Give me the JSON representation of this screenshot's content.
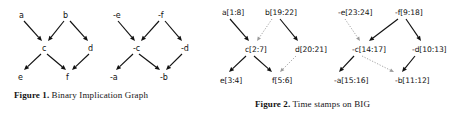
{
  "figures": [
    {
      "id": "figure-1",
      "caption_label": "Figure 1.",
      "caption_text": "Binary Implication Graph",
      "nodes": [
        {
          "name": "node-a",
          "label": "a",
          "x": 19,
          "y": 11
        },
        {
          "name": "node-b",
          "label": "b",
          "x": 63,
          "y": 11
        },
        {
          "name": "node-c",
          "label": "c",
          "x": 42,
          "y": 44
        },
        {
          "name": "node-d",
          "label": "d",
          "x": 88,
          "y": 44
        },
        {
          "name": "node-e",
          "label": "e",
          "x": 18,
          "y": 73
        },
        {
          "name": "node-f",
          "label": "f",
          "x": 66,
          "y": 73
        },
        {
          "name": "node-neg-e",
          "label": "-e",
          "x": 113,
          "y": 11
        },
        {
          "name": "node-neg-f",
          "label": "-f",
          "x": 158,
          "y": 11
        },
        {
          "name": "node-neg-c",
          "label": "-c",
          "x": 133,
          "y": 44
        },
        {
          "name": "node-neg-d",
          "label": "-d",
          "x": 181,
          "y": 44
        },
        {
          "name": "node-neg-a",
          "label": "-a",
          "x": 110,
          "y": 73
        },
        {
          "name": "node-neg-b",
          "label": "-b",
          "x": 160,
          "y": 73
        }
      ],
      "edges": [
        {
          "name": "edge-a-c",
          "from": [
            24,
            21
          ],
          "to": [
            42,
            41
          ],
          "style": "solid"
        },
        {
          "name": "edge-b-c",
          "from": [
            64,
            21
          ],
          "to": [
            48,
            41
          ],
          "style": "solid"
        },
        {
          "name": "edge-b-d",
          "from": [
            70,
            21
          ],
          "to": [
            88,
            41
          ],
          "style": "solid"
        },
        {
          "name": "edge-c-e",
          "from": [
            41,
            54
          ],
          "to": [
            24,
            70
          ],
          "style": "solid"
        },
        {
          "name": "edge-c-f",
          "from": [
            47,
            54
          ],
          "to": [
            66,
            70
          ],
          "style": "solid"
        },
        {
          "name": "edge-d-f",
          "from": [
            89,
            54
          ],
          "to": [
            72,
            70
          ],
          "style": "solid"
        },
        {
          "name": "edge-neg-e-neg-c",
          "from": [
            118,
            21
          ],
          "to": [
            135,
            41
          ],
          "style": "solid"
        },
        {
          "name": "edge-neg-f-neg-c",
          "from": [
            159,
            21
          ],
          "to": [
            141,
            41
          ],
          "style": "solid"
        },
        {
          "name": "edge-neg-f-neg-d",
          "from": [
            165,
            21
          ],
          "to": [
            182,
            41
          ],
          "style": "solid"
        },
        {
          "name": "edge-neg-c-neg-a",
          "from": [
            133,
            54
          ],
          "to": [
            116,
            70
          ],
          "style": "solid"
        },
        {
          "name": "edge-neg-c-neg-b",
          "from": [
            139,
            54
          ],
          "to": [
            160,
            70
          ],
          "style": "solid"
        },
        {
          "name": "edge-neg-d-neg-b",
          "from": [
            182,
            54
          ],
          "to": [
            166,
            70
          ],
          "style": "solid"
        }
      ]
    },
    {
      "id": "figure-2",
      "caption_label": "Figure 2.",
      "caption_text": "Time stamps on BIG",
      "nodes": [
        {
          "name": "node-a",
          "label": "a[1:8]",
          "x": 4,
          "y": 8
        },
        {
          "name": "node-b",
          "label": "b[19:22]",
          "x": 47,
          "y": 8
        },
        {
          "name": "node-c",
          "label": "c[2:7]",
          "x": 27,
          "y": 45
        },
        {
          "name": "node-d",
          "label": "d[20:21]",
          "x": 77,
          "y": 45
        },
        {
          "name": "node-e",
          "label": "e[3:4]",
          "x": 2,
          "y": 76
        },
        {
          "name": "node-f",
          "label": "f[5:6]",
          "x": 54,
          "y": 76
        },
        {
          "name": "node-neg-e",
          "label": "-e[23:24]",
          "x": 120,
          "y": 8
        },
        {
          "name": "node-neg-f",
          "label": "-f[9:18]",
          "x": 177,
          "y": 8
        },
        {
          "name": "node-neg-c",
          "label": "-c[14:17]",
          "x": 134,
          "y": 45
        },
        {
          "name": "node-neg-d",
          "label": "-d[10:13]",
          "x": 194,
          "y": 45
        },
        {
          "name": "node-neg-a",
          "label": "-a[15:16]",
          "x": 116,
          "y": 76
        },
        {
          "name": "node-neg-b",
          "label": "-b[11:12]",
          "x": 177,
          "y": 76
        }
      ],
      "edges": [
        {
          "name": "edge-a-c",
          "from": [
            12,
            19
          ],
          "to": [
            31,
            41
          ],
          "style": "solid"
        },
        {
          "name": "edge-b-c",
          "from": [
            54,
            19
          ],
          "to": [
            39,
            41
          ],
          "style": "dotted"
        },
        {
          "name": "edge-b-d",
          "from": [
            62,
            19
          ],
          "to": [
            80,
            41
          ],
          "style": "solid"
        },
        {
          "name": "edge-c-e",
          "from": [
            28,
            56
          ],
          "to": [
            11,
            72
          ],
          "style": "solid"
        },
        {
          "name": "edge-c-f",
          "from": [
            36,
            56
          ],
          "to": [
            54,
            72
          ],
          "style": "solid"
        },
        {
          "name": "edge-d-f",
          "from": [
            78,
            56
          ],
          "to": [
            62,
            72
          ],
          "style": "dotted"
        },
        {
          "name": "edge-neg-e-neg-c",
          "from": [
            127,
            19
          ],
          "to": [
            142,
            41
          ],
          "style": "dotted"
        },
        {
          "name": "edge-neg-f-neg-c",
          "from": [
            180,
            19
          ],
          "to": [
            151,
            41
          ],
          "style": "solid"
        },
        {
          "name": "edge-neg-f-neg-d",
          "from": [
            188,
            19
          ],
          "to": [
            203,
            41
          ],
          "style": "solid"
        },
        {
          "name": "edge-neg-c-neg-a",
          "from": [
            136,
            56
          ],
          "to": [
            121,
            72
          ],
          "style": "solid"
        },
        {
          "name": "edge-neg-c-neg-b",
          "from": [
            144,
            56
          ],
          "to": [
            176,
            72
          ],
          "style": "dotted"
        },
        {
          "name": "edge-neg-d-neg-b",
          "from": [
            197,
            56
          ],
          "to": [
            184,
            72
          ],
          "style": "solid"
        }
      ]
    }
  ],
  "colors": {
    "ink": "#111111",
    "edge_solid": "#111111",
    "edge_dotted": "#9a9a9a",
    "background": "#ffffff"
  }
}
